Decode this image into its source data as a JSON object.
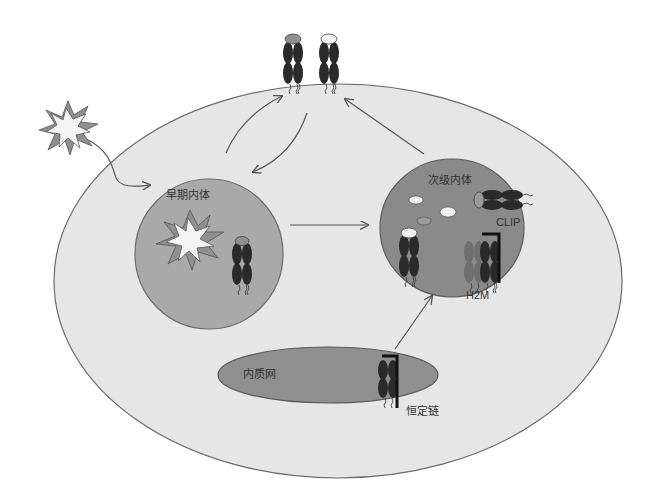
{
  "diagram": {
    "type": "cell-biology-schematic",
    "topic": "MHC class II antigen presentation pathway",
    "labels": {
      "early_endosome": "早期内体",
      "late_endosome": "次级内体",
      "er": "内质网",
      "invariant_chain": "恒定链",
      "clip": "CLIP",
      "h2m": "H2M"
    },
    "colors": {
      "background": "#ffffff",
      "cell_fill": "#e6e6e6",
      "cell_stroke": "#6b6b6b",
      "early_endosome_fill": "#a9a9a9",
      "late_endosome_fill": "#8a8a8a",
      "er_fill": "#8f8f8f",
      "mhc_dark": "#2a2a2a",
      "mhc_mid": "#707070",
      "peptide_grey": "#9a9a9a",
      "peptide_white": "#f2f2f2",
      "arrow": "#555555"
    },
    "nodes": [
      {
        "id": "antigen",
        "label": "",
        "shape": "star"
      },
      {
        "id": "cell_membrane",
        "label": "",
        "shape": "ellipse"
      },
      {
        "id": "early_endosome",
        "label": "早期内体",
        "shape": "ellipse"
      },
      {
        "id": "late_endosome",
        "label": "次级内体",
        "shape": "ellipse"
      },
      {
        "id": "er",
        "label": "内质网",
        "shape": "ellipse"
      },
      {
        "id": "surface_mhc_peptide",
        "label": "",
        "shape": "mhc-ii"
      },
      {
        "id": "surface_mhc_empty",
        "label": "",
        "shape": "mhc-ii"
      }
    ],
    "edges": [
      {
        "from": "antigen",
        "to": "early_endosome"
      },
      {
        "from": "early_endosome",
        "to": "surface_mhc_peptide"
      },
      {
        "from": "surface_mhc_peptide",
        "to": "early_endosome"
      },
      {
        "from": "early_endosome",
        "to": "late_endosome"
      },
      {
        "from": "er",
        "to": "late_endosome"
      },
      {
        "from": "late_endosome",
        "to": "surface_mhc_empty"
      }
    ]
  }
}
